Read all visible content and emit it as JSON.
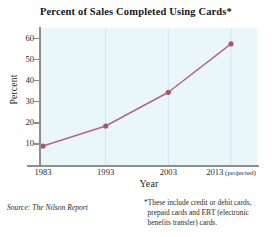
{
  "chart_data": {
    "type": "line",
    "title": "Percent of Sales Completed Using Cards*",
    "xlabel": "Year",
    "ylabel": "Percent",
    "categories": [
      "1983",
      "1993",
      "2003",
      "2013 (projected)"
    ],
    "x_tick_labels": [
      {
        "year": "1983",
        "suffix": ""
      },
      {
        "year": "1993",
        "suffix": ""
      },
      {
        "year": "2003",
        "suffix": ""
      },
      {
        "year": "2013",
        "suffix": "(projected)"
      }
    ],
    "values": [
      9,
      18.5,
      34.5,
      57.5
    ],
    "y_ticks": [
      10,
      20,
      30,
      40,
      50,
      60
    ],
    "ylim": [
      0,
      65
    ],
    "grid": "vertical",
    "legend": "none",
    "series": [
      {
        "name": "Percent of sales completed using cards",
        "values": [
          9,
          18.5,
          34.5,
          57.5
        ]
      }
    ],
    "line_color": "#b5667a",
    "marker_color": "#a9566c",
    "plot_background": "#eaf7fa",
    "gridline_color": "#cfe7ef",
    "axis_color": "#8e8e8e"
  },
  "notes": {
    "source": "Source: The Nilson Report",
    "footnote": "*These include credit or debit cards, prepaid cards and EBT (electronic benefits transfer) cards."
  }
}
